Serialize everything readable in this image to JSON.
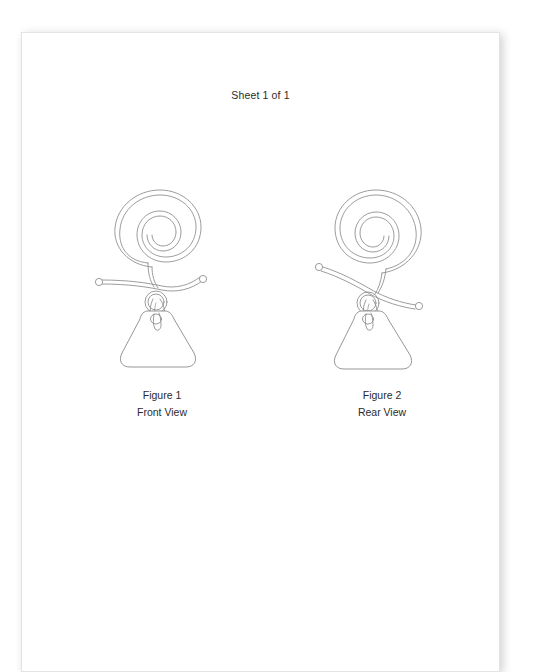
{
  "document": {
    "header": "Sheet 1 of 1",
    "page_background": "#ffffff",
    "paper_color": "#ffffff",
    "line_color": "#8a8a8a",
    "text_color": "#2b2b2b"
  },
  "figures": [
    {
      "id": "figure-1",
      "number_label": "Figure 1",
      "view_label": "Front View",
      "subject": "spiral wire earring with pendant plate"
    },
    {
      "id": "figure-2",
      "number_label": "Figure 2",
      "view_label": "Rear View",
      "subject": "spiral wire earring with pendant plate"
    }
  ]
}
